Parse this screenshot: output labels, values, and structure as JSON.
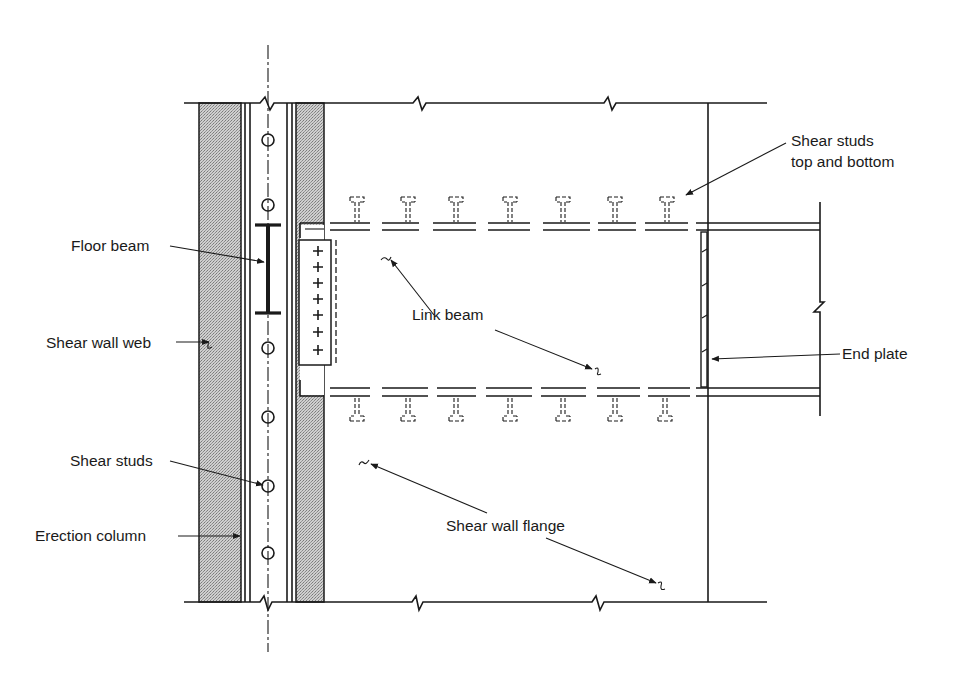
{
  "diagram": {
    "type": "structural-detail",
    "colors": {
      "ink": "#1a1a1a",
      "hatch": "#bdbdbd",
      "background": "#ffffff"
    },
    "labels": {
      "floor_beam": "Floor beam",
      "shear_wall_web": "Shear wall web",
      "shear_studs_col": "Shear studs",
      "erection_column": "Erection column",
      "link_beam": "Link beam",
      "shear_studs_tb_1": "Shear studs",
      "shear_studs_tb_2": "top and bottom",
      "end_plate": "End plate",
      "shear_wall_flange": "Shear wall flange"
    },
    "components": [
      "shear-wall-web (hatched concrete strips)",
      "erection-column (vertical steel section with centerline)",
      "column shear studs (6 circles)",
      "floor beam (I-section in elevation)",
      "link beam (top and bottom flanges, dashed embedded portions)",
      "connection plate with 7 bolts",
      "shear studs top and bottom (7 each)",
      "end plate",
      "shear wall flange boundary with break lines"
    ]
  }
}
